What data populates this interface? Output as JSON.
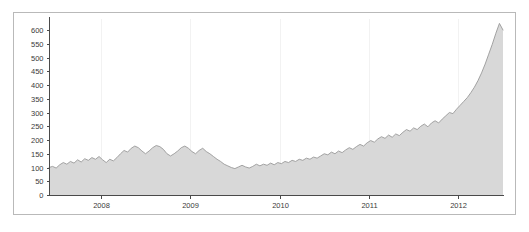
{
  "chart_data": {
    "type": "area",
    "title": "",
    "subtitle": "",
    "xlabel": "",
    "ylabel": "",
    "xlim": [
      2007.42,
      2012.5
    ],
    "ylim": [
      0,
      640
    ],
    "yticks": [
      0,
      50,
      100,
      150,
      200,
      250,
      300,
      350,
      400,
      450,
      500,
      550,
      600
    ],
    "ytick_labels": [
      "0",
      "50",
      "100",
      "150",
      "200",
      "250",
      "300",
      "350",
      "400",
      "450",
      "500",
      "550",
      "600"
    ],
    "xticks": [
      2008,
      2009,
      2010,
      2011,
      2012
    ],
    "xtick_labels": [
      "2008",
      "2009",
      "2010",
      "2011",
      "2012"
    ],
    "grid": "faint-vertical",
    "legend": null,
    "colors": {
      "area_fill": "#d8d8d8",
      "series_line": "#9a9a9a",
      "axis": "#4a4a4a",
      "frame": "#b9b9b9",
      "gridline": "#f2f2f2",
      "background": "#ffffff",
      "tick_text": "#3a3a3a"
    },
    "series": [
      {
        "name": "value",
        "x": [
          2007.42,
          2007.46,
          2007.5,
          2007.54,
          2007.58,
          2007.62,
          2007.66,
          2007.7,
          2007.74,
          2007.78,
          2007.82,
          2007.86,
          2007.9,
          2007.94,
          2007.98,
          2008.02,
          2008.06,
          2008.1,
          2008.14,
          2008.18,
          2008.22,
          2008.26,
          2008.3,
          2008.34,
          2008.38,
          2008.42,
          2008.46,
          2008.5,
          2008.54,
          2008.58,
          2008.62,
          2008.66,
          2008.7,
          2008.74,
          2008.78,
          2008.82,
          2008.86,
          2008.9,
          2008.94,
          2008.98,
          2009.02,
          2009.06,
          2009.1,
          2009.14,
          2009.18,
          2009.22,
          2009.26,
          2009.3,
          2009.34,
          2009.38,
          2009.42,
          2009.46,
          2009.5,
          2009.54,
          2009.58,
          2009.62,
          2009.66,
          2009.7,
          2009.74,
          2009.78,
          2009.82,
          2009.86,
          2009.9,
          2009.94,
          2009.98,
          2010.02,
          2010.06,
          2010.1,
          2010.14,
          2010.18,
          2010.22,
          2010.26,
          2010.3,
          2010.34,
          2010.38,
          2010.42,
          2010.46,
          2010.5,
          2010.54,
          2010.58,
          2010.62,
          2010.66,
          2010.7,
          2010.74,
          2010.78,
          2010.82,
          2010.86,
          2010.9,
          2010.94,
          2010.98,
          2011.02,
          2011.06,
          2011.1,
          2011.14,
          2011.18,
          2011.22,
          2011.26,
          2011.3,
          2011.34,
          2011.38,
          2011.42,
          2011.46,
          2011.5,
          2011.54,
          2011.58,
          2011.62,
          2011.66,
          2011.7,
          2011.74,
          2011.78,
          2011.82,
          2011.86,
          2011.9,
          2011.94,
          2011.98,
          2012.02,
          2012.06,
          2012.1,
          2012.14,
          2012.18,
          2012.22,
          2012.26,
          2012.3,
          2012.34,
          2012.38,
          2012.42,
          2012.46,
          2012.5
        ],
        "values": [
          100,
          104,
          98,
          110,
          118,
          112,
          122,
          116,
          128,
          120,
          132,
          126,
          136,
          130,
          140,
          128,
          118,
          130,
          124,
          136,
          150,
          162,
          156,
          170,
          178,
          172,
          160,
          150,
          160,
          172,
          180,
          176,
          166,
          150,
          142,
          150,
          160,
          172,
          178,
          170,
          158,
          150,
          162,
          170,
          158,
          150,
          140,
          130,
          122,
          112,
          106,
          100,
          96,
          102,
          108,
          102,
          98,
          104,
          112,
          106,
          112,
          108,
          116,
          110,
          118,
          114,
          122,
          118,
          126,
          122,
          130,
          126,
          134,
          130,
          138,
          134,
          142,
          150,
          146,
          156,
          150,
          160,
          154,
          164,
          172,
          166,
          176,
          184,
          178,
          190,
          198,
          192,
          204,
          212,
          206,
          218,
          210,
          222,
          216,
          228,
          238,
          232,
          244,
          238,
          250,
          258,
          248,
          262,
          270,
          262,
          276,
          288,
          300,
          296,
          312,
          326,
          340,
          354,
          372,
          392,
          416,
          444,
          476,
          512,
          548,
          588,
          624,
          600
        ]
      }
    ]
  },
  "axes": {
    "y_axis_name": "value-axis",
    "x_axis_name": "time-axis"
  }
}
